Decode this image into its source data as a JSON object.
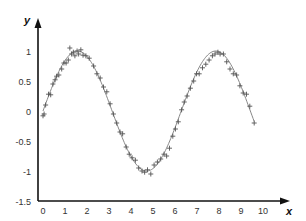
{
  "chart_data": {
    "type": "scatter",
    "title": "",
    "xlabel": "x",
    "ylabel": "y",
    "xlim": [
      0,
      10.5
    ],
    "ylim": [
      -1.5,
      1.2
    ],
    "grid": false,
    "legend": null,
    "x_ticks": [
      "0",
      "1",
      "2",
      "3",
      "4",
      "5",
      "6",
      "7",
      "8",
      "9",
      "10"
    ],
    "y_ticks": [
      "1",
      "0.5",
      "0",
      "-0.5",
      "-1",
      "-1.5"
    ],
    "series": [
      {
        "name": "noisy samples",
        "marker": "+",
        "color": "#555555",
        "x": [
          0.0,
          0.05,
          0.12,
          0.25,
          0.35,
          0.45,
          0.55,
          0.62,
          0.72,
          0.85,
          0.95,
          1.05,
          1.15,
          1.22,
          1.3,
          1.38,
          1.45,
          1.55,
          1.62,
          1.72,
          1.82,
          1.95,
          2.1,
          2.3,
          2.45,
          2.6,
          2.75,
          2.9,
          3.05,
          3.2,
          3.35,
          3.5,
          3.62,
          3.78,
          3.92,
          4.05,
          4.2,
          4.35,
          4.5,
          4.62,
          4.75,
          4.9,
          5.05,
          5.2,
          5.35,
          5.5,
          5.62,
          5.75,
          5.9,
          6.02,
          6.15,
          6.3,
          6.42,
          6.55,
          6.7,
          6.85,
          6.98,
          7.1,
          7.25,
          7.4,
          7.55,
          7.7,
          7.82,
          7.95,
          8.05,
          8.2,
          8.35,
          8.5,
          8.65,
          8.8,
          8.95,
          9.1,
          9.25,
          9.4,
          9.6
        ],
        "y": [
          -0.08,
          -0.05,
          0.1,
          0.28,
          0.27,
          0.45,
          0.52,
          0.58,
          0.6,
          0.7,
          0.8,
          0.8,
          0.85,
          1.05,
          0.95,
          0.98,
          0.92,
          1.0,
          0.95,
          1.02,
          0.93,
          0.92,
          0.88,
          0.75,
          0.62,
          0.55,
          0.4,
          0.32,
          0.12,
          -0.05,
          -0.2,
          -0.35,
          -0.38,
          -0.6,
          -0.72,
          -0.78,
          -0.82,
          -0.95,
          -1.0,
          -1.02,
          -0.98,
          -1.05,
          -0.9,
          -0.85,
          -0.8,
          -0.72,
          -0.75,
          -0.62,
          -0.42,
          -0.3,
          -0.18,
          0.02,
          0.15,
          0.25,
          0.38,
          0.5,
          0.62,
          0.62,
          0.72,
          0.78,
          0.85,
          0.92,
          0.95,
          0.98,
          0.95,
          0.95,
          0.82,
          0.7,
          0.62,
          0.6,
          0.42,
          0.3,
          0.28,
          0.08,
          -0.2
        ]
      },
      {
        "name": "fit",
        "type": "line",
        "function": "sin(x)",
        "color": "#888888",
        "x_range": [
          0,
          9.6
        ]
      }
    ]
  }
}
